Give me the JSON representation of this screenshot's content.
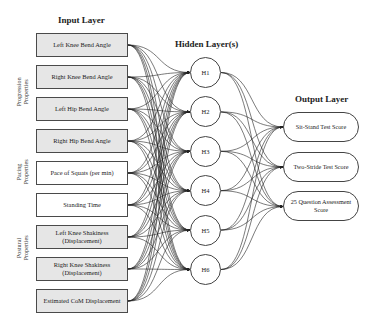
{
  "titles": {
    "input_layer": "Input Layer",
    "hidden_layer": "Hidden Layer(s)",
    "output_layer": "Output Layer"
  },
  "groups": [
    {
      "label": "Progression\nProperties",
      "line1": "Progression",
      "line2": "Properties"
    },
    {
      "label": "Pacing\nProperties",
      "line1": "Pacing",
      "line2": "Properties"
    },
    {
      "label": "Postural\nProperties",
      "line1": "Postural",
      "line2": "Properties"
    }
  ],
  "inputs": [
    {
      "label": "Left Knee Bend Angle",
      "group": "progression",
      "fill": "#e6e6e6"
    },
    {
      "label": "Right Knee Bend Angle",
      "group": "progression",
      "fill": "#e6e6e6"
    },
    {
      "label": "Left Hip Bend Angle",
      "group": "progression",
      "fill": "#e6e6e6"
    },
    {
      "label": "Right Hip Bend Angle",
      "group": "progression",
      "fill": "#e6e6e6"
    },
    {
      "label": "Pace of Squats (per min)",
      "group": "pacing",
      "fill": "#ffffff"
    },
    {
      "label": "Standing Time",
      "group": "pacing",
      "fill": "#ffffff"
    },
    {
      "label": "Left Knee Shakiness (Displacement)",
      "group": "postural",
      "fill": "#e6e6e6"
    },
    {
      "label": "Right Knee Shakiness (Displacement)",
      "group": "postural",
      "fill": "#e6e6e6"
    },
    {
      "label": "Estimated CoM Displacement",
      "group": "postural",
      "fill": "#e6e6e6"
    }
  ],
  "hidden": [
    {
      "label": "H1"
    },
    {
      "label": "H2"
    },
    {
      "label": "H3"
    },
    {
      "label": "H4"
    },
    {
      "label": "H5"
    },
    {
      "label": "H6"
    }
  ],
  "outputs": [
    {
      "label": "Sit-Stand Test Score"
    },
    {
      "label": "Two-Stride Test Score"
    },
    {
      "label": "25 Question Assessment Score"
    }
  ],
  "connections": {
    "input_to_hidden": "fully-connected",
    "hidden_to_output": "fully-connected",
    "edge_color": "#222222"
  }
}
